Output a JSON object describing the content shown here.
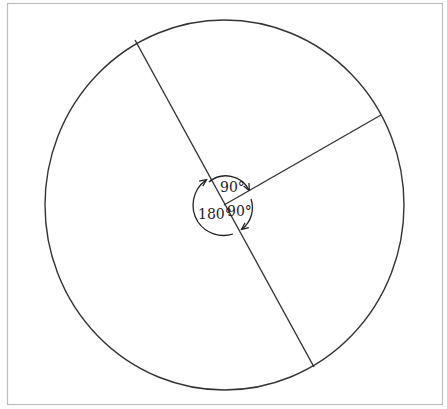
{
  "diagram": {
    "title": "",
    "angles": [
      {
        "id": "top",
        "label": "90°",
        "value_deg": 90
      },
      {
        "id": "right",
        "label": "90°",
        "value_deg": 90
      },
      {
        "id": "left",
        "label": "180°",
        "value_deg": 180
      }
    ],
    "total_deg": 360,
    "colors": {
      "stroke": "#333333",
      "frame": "#bdbdbd",
      "background": "#ffffff"
    }
  }
}
